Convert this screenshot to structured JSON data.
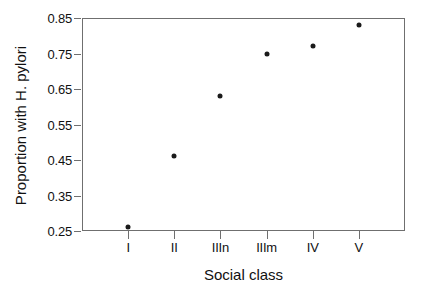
{
  "chart_data": {
    "type": "scatter",
    "title": "",
    "xlabel": "Social class",
    "ylabel": "Proportion with H. pylori",
    "categories": [
      "I",
      "II",
      "IIIn",
      "IIIm",
      "IV",
      "V"
    ],
    "values": [
      0.26,
      0.46,
      0.63,
      0.75,
      0.77,
      0.83
    ],
    "series": [
      {
        "name": "Proportion with H. pylori",
        "values": [
          0.26,
          0.46,
          0.63,
          0.75,
          0.77,
          0.83
        ]
      }
    ],
    "ylim": [
      0.22,
      0.86
    ],
    "yticks": [
      0.25,
      0.35,
      0.45,
      0.55,
      0.65,
      0.75,
      0.85
    ],
    "ytick_labels": [
      "0.25",
      "0.35",
      "0.45",
      "0.55",
      "0.65",
      "0.75",
      "0.85"
    ],
    "xtick_labels": [
      "I",
      "II",
      "IIIn",
      "IIIm",
      "IV",
      "V"
    ],
    "grid": false,
    "legend": "none",
    "marker": "filled-circle",
    "marker_color": "#1a1a1a",
    "frame_color": "#6f6f6f"
  },
  "axes": {
    "y_title": "Proportion with H. pylori",
    "x_title": "Social class",
    "y_ticks": [
      {
        "label": "0.85",
        "value": 0.85
      },
      {
        "label": "0.75",
        "value": 0.75
      },
      {
        "label": "0.65",
        "value": 0.65
      },
      {
        "label": "0.55",
        "value": 0.55
      },
      {
        "label": "0.45",
        "value": 0.45
      },
      {
        "label": "0.35",
        "value": 0.35
      },
      {
        "label": "0.25",
        "value": 0.25
      }
    ],
    "x_ticks": [
      {
        "label": "I",
        "value": 1
      },
      {
        "label": "II",
        "value": 2
      },
      {
        "label": "IIIn",
        "value": 3
      },
      {
        "label": "IIIm",
        "value": 4
      },
      {
        "label": "IV",
        "value": 5
      },
      {
        "label": "V",
        "value": 6
      }
    ]
  },
  "points": [
    {
      "x_label": "I",
      "y": 0.26
    },
    {
      "x_label": "II",
      "y": 0.46
    },
    {
      "x_label": "IIIn",
      "y": 0.63
    },
    {
      "x_label": "IIIm",
      "y": 0.75
    },
    {
      "x_label": "IV",
      "y": 0.77
    },
    {
      "x_label": "V",
      "y": 0.83
    }
  ]
}
